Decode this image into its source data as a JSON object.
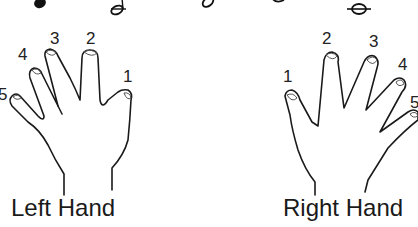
{
  "notes_row": {
    "description": "partial music notes cut off at top edge",
    "notes": [
      "filled-note-head",
      "half-note",
      "half-note",
      "half-note",
      "whole-note"
    ]
  },
  "left_hand": {
    "label": "Left Hand",
    "fingers": [
      {
        "number": "5"
      },
      {
        "number": "4"
      },
      {
        "number": "3"
      },
      {
        "number": "2"
      },
      {
        "number": "1"
      }
    ]
  },
  "right_hand": {
    "label": "Right Hand",
    "fingers": [
      {
        "number": "1"
      },
      {
        "number": "2"
      },
      {
        "number": "3"
      },
      {
        "number": "4"
      },
      {
        "number": "5"
      }
    ]
  },
  "colors": {
    "background": "#ffffff",
    "ink": "#1a1a1a"
  }
}
